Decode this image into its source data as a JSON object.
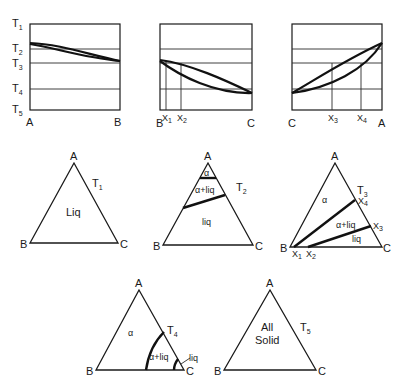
{
  "figure": {
    "binary_diagrams": [
      {
        "id": "A-B",
        "left_label": "A",
        "right_label": "B",
        "temp_labels": [
          "T",
          "T",
          "T",
          "T",
          "T"
        ],
        "temp_subs": [
          "1",
          "2",
          "3",
          "4",
          "5"
        ],
        "markers": []
      },
      {
        "id": "B-C",
        "left_label": "B",
        "right_label": "C",
        "markers": [
          {
            "label": "X",
            "sub": "1"
          },
          {
            "label": "X",
            "sub": "2"
          }
        ]
      },
      {
        "id": "C-A",
        "left_label": "C",
        "right_label": "A",
        "markers": [
          {
            "label": "X",
            "sub": "3"
          },
          {
            "label": "X",
            "sub": "4"
          }
        ]
      }
    ],
    "ternary_sections": [
      {
        "temp": "T",
        "temp_sub": "1",
        "vertices": {
          "top": "A",
          "left": "B",
          "right": "C"
        },
        "regions": [
          "Liq"
        ]
      },
      {
        "temp": "T",
        "temp_sub": "2",
        "vertices": {
          "top": "A",
          "left": "B",
          "right": "C"
        },
        "regions": [
          "α",
          "α+liq",
          "liq"
        ]
      },
      {
        "temp": "T",
        "temp_sub": "3",
        "vertices": {
          "top": "A",
          "left": "B",
          "right": "C"
        },
        "regions": [
          "α",
          "α+liq",
          "liq"
        ],
        "markers": [
          {
            "label": "X",
            "sub": "4"
          },
          {
            "label": "X",
            "sub": "3"
          },
          {
            "label": "X",
            "sub": "1"
          },
          {
            "label": "X",
            "sub": "2"
          }
        ]
      },
      {
        "temp": "T",
        "temp_sub": "4",
        "vertices": {
          "top": "A",
          "left": "B",
          "right": "C"
        },
        "regions": [
          "α",
          "α+liq",
          "liq"
        ]
      },
      {
        "temp": "T",
        "temp_sub": "5",
        "vertices": {
          "top": "A",
          "left": "B",
          "right": "C"
        },
        "regions": [
          "All",
          "Solid"
        ]
      }
    ]
  }
}
